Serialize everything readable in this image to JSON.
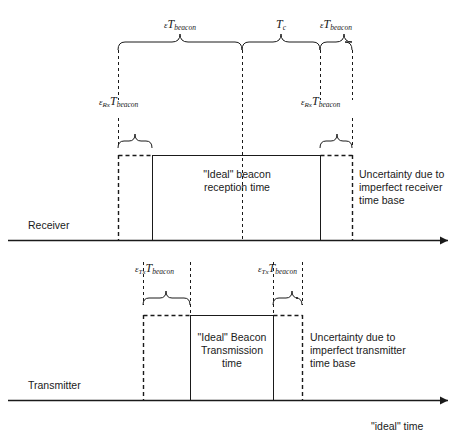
{
  "diagram": {
    "ideal_time_label": "\"ideal\" time",
    "stroke_color": "#1a1a1a"
  },
  "top_braces": [
    {
      "label_eps": "ε",
      "label_T": "T",
      "label_sub": "beacon",
      "text": "εT beacon"
    },
    {
      "label_eps": "",
      "label_T": "T",
      "label_sub": "c",
      "text": "T c"
    },
    {
      "label_eps": "ε",
      "label_T": "T",
      "label_sub": "beacon",
      "text": "εT beacon"
    }
  ],
  "receiver": {
    "axis_label": "Receiver",
    "inner_text": "\"Ideal\" beacon\nreception time",
    "uncertainty_text": "Uncertainty due to\nimperfect receiver\ntime base",
    "eps_labels": [
      {
        "eps": "ε",
        "eps_sub": "Rx",
        "T": "T",
        "T_sub": "beacon"
      },
      {
        "eps": "ε",
        "eps_sub": "Rx",
        "T": "T",
        "T_sub": "beacon"
      }
    ]
  },
  "transmitter": {
    "axis_label": "Transmitter",
    "inner_text": "\"Ideal\" Beacon\nTransmission\ntime",
    "uncertainty_text": "Uncertainty due to\nimperfect transmitter\ntime base",
    "eps_labels": [
      {
        "eps": "ε",
        "eps_sub": "Tx",
        "T": "T",
        "T_sub": "beacon"
      },
      {
        "eps": "ε",
        "eps_sub": "Tx",
        "T": "T",
        "T_sub": "beacon"
      }
    ]
  }
}
